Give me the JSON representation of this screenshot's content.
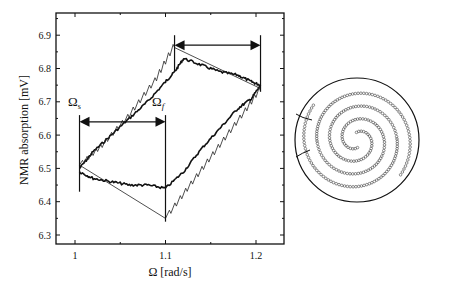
{
  "chart_data": [
    {
      "type": "line",
      "title": "",
      "xlabel": "Ω [rad/s]",
      "ylabel": "NMR absorption [mV]",
      "xlim": [
        0.98,
        1.225
      ],
      "ylim": [
        6.29,
        6.97
      ],
      "xticks": [
        1,
        1.1,
        1.2
      ],
      "xtick_labels": [
        "1",
        "1.1",
        "1.2"
      ],
      "yticks": [
        6.3,
        6.4,
        6.5,
        6.6,
        6.7,
        6.8,
        6.9
      ],
      "ytick_labels": [
        "6.3",
        "6.4",
        "6.5",
        "6.6",
        "6.7",
        "6.8",
        "6.9"
      ],
      "grid": false,
      "legend": null,
      "series": [
        {
          "name": "measured (thick) upper branch",
          "style": "thick",
          "x": [
            1.005,
            1.02,
            1.04,
            1.06,
            1.08,
            1.1,
            1.11,
            1.12,
            1.14,
            1.16,
            1.18,
            1.195,
            1.205
          ],
          "y": [
            6.5,
            6.55,
            6.6,
            6.65,
            6.7,
            6.76,
            6.79,
            6.83,
            6.81,
            6.79,
            6.78,
            6.76,
            6.75
          ]
        },
        {
          "name": "measured (thick) lower branch",
          "style": "thick",
          "x": [
            1.005,
            1.02,
            1.04,
            1.06,
            1.08,
            1.1,
            1.12,
            1.14,
            1.16,
            1.18,
            1.195,
            1.205
          ],
          "y": [
            6.49,
            6.47,
            6.46,
            6.45,
            6.45,
            6.44,
            6.49,
            6.56,
            6.62,
            6.68,
            6.71,
            6.75
          ]
        },
        {
          "name": "model (thin) upper branch",
          "style": "thin-sawtooth",
          "x": [
            1.005,
            1.03,
            1.06,
            1.09,
            1.11,
            1.205
          ],
          "y": [
            6.51,
            6.57,
            6.66,
            6.77,
            6.87,
            6.74
          ]
        },
        {
          "name": "model (thin) lower branch",
          "style": "thin-sawtooth",
          "x": [
            1.005,
            1.1,
            1.13,
            1.16,
            1.19,
            1.205
          ],
          "y": [
            6.51,
            6.35,
            6.46,
            6.57,
            6.68,
            6.74
          ]
        }
      ],
      "annotations": [
        {
          "text": "Ωs",
          "x": 1.005,
          "y": 6.68,
          "type": "label"
        },
        {
          "text": "Ωf",
          "x": 1.1,
          "y": 6.68,
          "type": "label"
        },
        {
          "type": "double-arrow",
          "x0": 1.005,
          "x1": 1.1,
          "y": 6.64
        },
        {
          "type": "double-arrow",
          "x0": 1.11,
          "x1": 1.205,
          "y": 6.87
        },
        {
          "type": "vline",
          "x": 1.005,
          "y0": 6.43,
          "y1": 6.66
        },
        {
          "type": "vline",
          "x": 1.1,
          "y0": 6.34,
          "y1": 6.66
        },
        {
          "type": "vline",
          "x": 1.11,
          "y0": 6.79,
          "y1": 6.9
        },
        {
          "type": "vline",
          "x": 1.205,
          "y0": 6.73,
          "y1": 6.9
        }
      ]
    },
    {
      "type": "diagram",
      "title": "",
      "description": "Circle containing a spiral of small beads (vortex pattern schematic)"
    }
  ],
  "labels": {
    "omega_s": "Ω",
    "omega_s_sub": "s",
    "omega_f": "Ω",
    "omega_f_sub": "f",
    "xlabel": "Ω [rad/s]",
    "ylabel": "NMR absorption [mV]"
  }
}
